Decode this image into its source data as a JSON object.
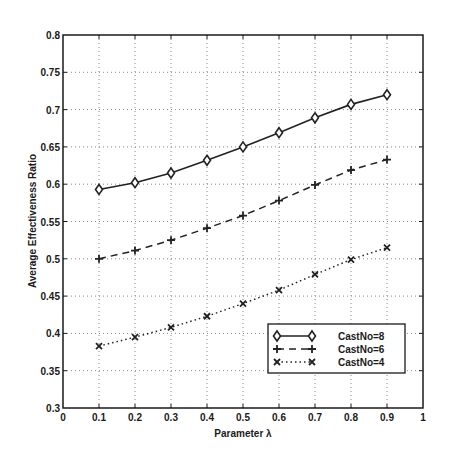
{
  "chart_data": {
    "type": "line",
    "title": "",
    "xlabel": "Parameter λ",
    "ylabel": "Average Effectiveness Ratio",
    "xlim": [
      0,
      1
    ],
    "ylim": [
      0.3,
      0.8
    ],
    "grid": true,
    "legend_position": "lower right",
    "x_ticks": [
      "0",
      "0.1",
      "0.2",
      "0.3",
      "0.4",
      "0.5",
      "0.6",
      "0.7",
      "0.8",
      "0.9",
      "1"
    ],
    "y_ticks": [
      "0.3",
      "0.35",
      "0.4",
      "0.45",
      "0.5",
      "0.55",
      "0.6",
      "0.65",
      "0.7",
      "0.75",
      "0.8"
    ],
    "x": [
      0.1,
      0.2,
      0.3,
      0.4,
      0.5,
      0.6,
      0.7,
      0.8,
      0.9
    ],
    "series": [
      {
        "name": "CastNo=8",
        "line_style": "solid",
        "marker": "diamond",
        "values": [
          0.593,
          0.602,
          0.615,
          0.632,
          0.65,
          0.669,
          0.689,
          0.707,
          0.72
        ]
      },
      {
        "name": "CastNo=6",
        "line_style": "dashed",
        "marker": "plus",
        "values": [
          0.5,
          0.511,
          0.525,
          0.541,
          0.558,
          0.578,
          0.599,
          0.619,
          0.633
        ]
      },
      {
        "name": "CastNo=4",
        "line_style": "dotted",
        "marker": "x",
        "values": [
          0.383,
          0.395,
          0.408,
          0.423,
          0.44,
          0.458,
          0.479,
          0.499,
          0.515
        ]
      }
    ]
  },
  "colors": {
    "axis": "#1a1a1a",
    "grid": "#8a8a8a",
    "series": "#222222",
    "background": "#ffffff"
  }
}
